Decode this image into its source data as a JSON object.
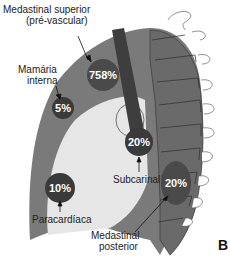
{
  "figure": {
    "panel_letter": "B",
    "colors": {
      "mediastinum": "#7a7a7a",
      "spine": "#6e6e6e",
      "heart": "#e6e6e6",
      "region": "#4a4a4a",
      "trachea": "#3e3e3e",
      "outline": "#333333"
    },
    "regions": [
      {
        "name": "Medastinal superior (pré-vascular)",
        "value": "758%"
      },
      {
        "name": "Mamária interna",
        "value": "5%"
      },
      {
        "name": "Subcarinal",
        "value": "20%"
      },
      {
        "name": "Paracardíaca",
        "value": "10%"
      },
      {
        "name": "Medastinal posterior",
        "value": "20%"
      }
    ],
    "labels": {
      "superior_line1": "Medastinal superior",
      "superior_line2": "(pré-vascular)",
      "mamaria_line1": "Mamária",
      "mamaria_line2": "interna",
      "subcarinal": "Subcarinal",
      "paracardiaca": "Paracardíaca",
      "posterior_line1": "Medastinal",
      "posterior_line2": "posterior"
    },
    "values": {
      "superior": "758%",
      "mamaria": "5%",
      "subcarinal": "20%",
      "paracardiaca": "10%",
      "posterior": "20%"
    }
  }
}
